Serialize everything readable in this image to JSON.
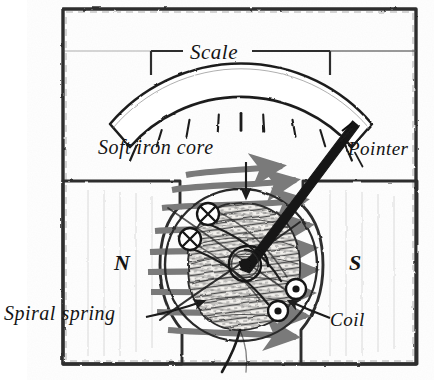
{
  "figure": {
    "background_color": "#ffffff",
    "ink_color": "#141414",
    "field_arrow_color": "#7a7a7a",
    "width": 434,
    "height": 380
  },
  "labels": {
    "scale": "Scale",
    "soft_iron_core": "Soft iron core",
    "pointer": "Pointer",
    "spiral_spring": "Spiral spring",
    "coil": "Coil",
    "north_pole": "N",
    "south_pole": "S"
  },
  "diagram": {
    "frame": {
      "name": "outer-case",
      "x": 62,
      "y": 8,
      "width": 355,
      "height": 357,
      "stroke": "#333333"
    },
    "scale_arc": {
      "name": "scale-arc-band",
      "center_x": 241,
      "center_y": 262,
      "inner_radius": 148,
      "outer_radius": 172,
      "start_angle_deg": 208,
      "end_angle_deg": 332,
      "tick_count": 11,
      "long_tick_index": 5
    },
    "scale_bracket": {
      "left_x": 151,
      "right_x": 330,
      "y": 51,
      "drop": 22
    },
    "pole_pieces": {
      "north": {
        "label": "N",
        "side": "left",
        "x": 62,
        "y": 181,
        "width": 118,
        "height": 184
      },
      "south": {
        "label": "S",
        "side": "right",
        "x": 303,
        "y": 181,
        "width": 114,
        "height": 184
      }
    },
    "coil_circle": {
      "name": "coil-boundary",
      "center_x": 241,
      "center_y": 265,
      "radius": 76
    },
    "soft_iron_core_shape": {
      "name": "hatched-core",
      "center_x": 243,
      "center_y": 268,
      "rx": 55,
      "ry": 62
    },
    "pivot": {
      "name": "spiral-spring-pivot",
      "center_x": 245,
      "center_y": 264,
      "turns": 3,
      "outer_radius": 15
    },
    "pointer_needle": {
      "name": "pointer-needle",
      "from_x": 245,
      "from_y": 264,
      "to_x": 356,
      "to_y": 123,
      "base_width": 9,
      "tip_width": 2
    },
    "current_into_page": [
      {
        "cx": 208,
        "cy": 214,
        "r": 11,
        "symbol": "cross-in-circle"
      },
      {
        "cx": 190,
        "cy": 239,
        "r": 11,
        "symbol": "cross-in-circle"
      }
    ],
    "current_out_of_page": [
      {
        "cx": 296,
        "cy": 289,
        "r": 10,
        "symbol": "dot-in-circle"
      },
      {
        "cx": 278,
        "cy": 311,
        "r": 10,
        "symbol": "dot-in-circle"
      }
    ],
    "field_arrows": {
      "direction": "left-to-right (N to S)",
      "count": 9,
      "color": "#7a7a7a"
    },
    "leaders": {
      "core_arrow": {
        "from_x": 246,
        "from_y": 163,
        "to_x": 246,
        "to_y": 200
      },
      "spring_arrow": {
        "from_x": 148,
        "from_y": 316,
        "to_x": 206,
        "to_y": 300
      },
      "coil_arrow": {
        "from_x": 328,
        "from_y": 318,
        "to_x": 286,
        "to_y": 300
      },
      "pointer_tick": {
        "x": 345,
        "y": 135
      }
    },
    "lead_wire": {
      "name": "terminal-wire",
      "path": "from coil bottom curving down past case"
    }
  }
}
